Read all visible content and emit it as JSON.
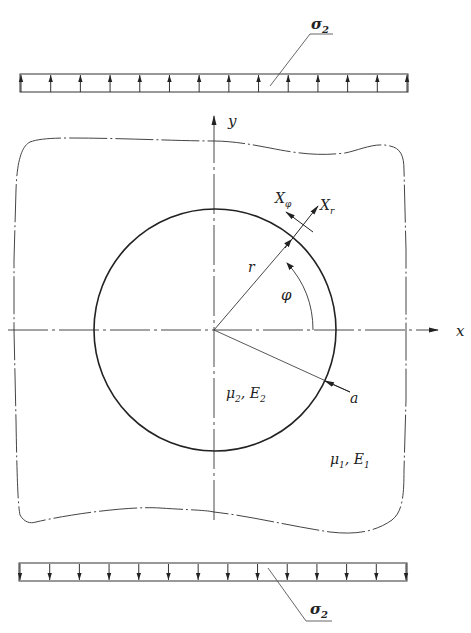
{
  "diagram": {
    "type": "mechanics-schematic",
    "labels": {
      "load_top": "σ",
      "load_top_sub": "2",
      "load_bottom": "σ",
      "load_bottom_sub": "2",
      "axis_x": "x",
      "axis_y": "y",
      "radius": "r",
      "angle": "φ",
      "force_phi": "X",
      "force_phi_sub": "φ",
      "force_r": "X",
      "force_r_sub": "r",
      "radius_a": "a",
      "inclusion_material": "μ",
      "inclusion_material_sub": "2",
      "inclusion_material_sep": ", E",
      "inclusion_material_sub2": "2",
      "matrix_material": "μ",
      "matrix_material_sub": "1",
      "matrix_material_sep": ", E",
      "matrix_material_sub2": "1"
    },
    "load_bars": {
      "top": {
        "arrow_count": 14,
        "direction": "up"
      },
      "bottom": {
        "arrow_count": 14,
        "direction": "down"
      }
    },
    "colors": {
      "line": "#333333",
      "background": "#ffffff"
    }
  }
}
